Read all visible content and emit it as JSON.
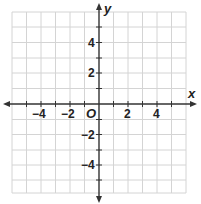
{
  "figure": {
    "type": "coordinate-plane",
    "x_axis": {
      "name": "x",
      "range": [
        -6,
        6
      ],
      "tick_labels": [
        "-4",
        "-2",
        "2",
        "4"
      ],
      "tick_values": [
        -4,
        -2,
        2,
        4
      ]
    },
    "y_axis": {
      "name": "y",
      "range": [
        -6,
        6
      ],
      "tick_labels": [
        "4",
        "2",
        "-2",
        "-4"
      ],
      "tick_values": [
        4,
        2,
        -2,
        -4
      ]
    },
    "origin_label": "O",
    "grid": true,
    "colors": {
      "grid": "#d4d4d4",
      "axis": "#333333",
      "text": "#222222"
    }
  },
  "labels": {
    "x_name": "x",
    "y_name": "y",
    "origin": "O",
    "x_neg4": "−4",
    "x_neg2": "−2",
    "x_pos2": "2",
    "x_pos4": "4",
    "y_pos4": "4",
    "y_pos2": "2",
    "y_neg2": "−2",
    "y_neg4": "−4"
  }
}
